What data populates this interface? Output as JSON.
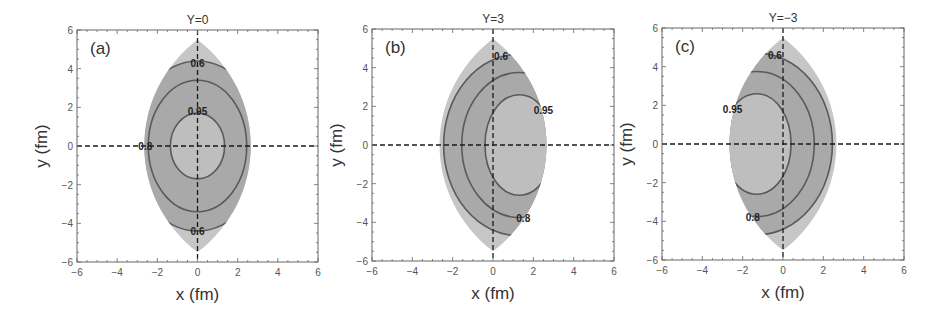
{
  "colors": {
    "background": "#ffffff",
    "frame": "#666666",
    "outer_region": "#c6c6c6",
    "middle_region": "#a9a9a9",
    "inner_region": "#bebebe",
    "contour_line": "#5a5a5a",
    "axis_dash": "#1a1a1a"
  },
  "chart_data": [
    {
      "type": "contour",
      "panel_tag": "(a)",
      "title": "Y=0",
      "xlabel": "x (fm)",
      "ylabel": "y (fm)",
      "xlim": [
        -6,
        6
      ],
      "ylim": [
        -6,
        6
      ],
      "xticks": [
        -6,
        -4,
        -2,
        0,
        2,
        4,
        6
      ],
      "yticks": [
        -6,
        -4,
        -2,
        0,
        2,
        4,
        6
      ],
      "grid": false,
      "dashed_axes_at_origin": true,
      "region": {
        "shape": "lens",
        "half_width": 2.65,
        "half_height": 5.5
      },
      "contours": [
        {
          "level": 0.6,
          "shape": "ellipse",
          "cx": 0,
          "cy": 0,
          "rx": 3.3,
          "ry": 4.4,
          "label_pos": [
            0,
            4.3
          ]
        },
        {
          "level": 0.8,
          "shape": "ellipse",
          "cx": 0,
          "cy": 0,
          "rx": 2.45,
          "ry": 3.4,
          "label_pos": [
            -2.6,
            0
          ]
        },
        {
          "level": 0.95,
          "shape": "ellipse",
          "cx": 0,
          "cy": 0,
          "rx": 1.35,
          "ry": 1.7,
          "label_pos": [
            0,
            1.8
          ]
        }
      ],
      "extra_labels": [
        {
          "text": "0.6",
          "pos": [
            0,
            -4.4
          ]
        }
      ]
    },
    {
      "type": "contour",
      "panel_tag": "(b)",
      "title": "Y=3",
      "xlabel": "x (fm)",
      "ylabel": "y (fm)",
      "xlim": [
        -6,
        6
      ],
      "ylim": [
        -6,
        6
      ],
      "xticks": [
        -6,
        -4,
        -2,
        0,
        2,
        4,
        6
      ],
      "yticks": [
        -6,
        -4,
        -2,
        0,
        2,
        4,
        6
      ],
      "grid": false,
      "dashed_axes_at_origin": true,
      "region": {
        "shape": "lens",
        "half_width": 2.65,
        "half_height": 5.5
      },
      "contours": [
        {
          "level": 0.6,
          "shape": "ellipse",
          "cx": 1.3,
          "cy": 0,
          "rx": 3.75,
          "ry": 4.7,
          "label_pos": [
            0.4,
            4.6
          ]
        },
        {
          "level": 0.8,
          "shape": "ellipse",
          "cx": 1.3,
          "cy": 0,
          "rx": 2.85,
          "ry": 3.75,
          "label_pos": [
            1.5,
            -3.8
          ]
        },
        {
          "level": 0.95,
          "shape": "ellipse",
          "cx": 1.3,
          "cy": 0,
          "rx": 1.7,
          "ry": 2.6,
          "label_pos": [
            2.5,
            1.8
          ]
        }
      ],
      "extra_labels": []
    },
    {
      "type": "contour",
      "panel_tag": "(c)",
      "title": "Y=−3",
      "xlabel": "x (fm)",
      "ylabel": "y (fm)",
      "xlim": [
        -6,
        6
      ],
      "ylim": [
        -6,
        6
      ],
      "xticks": [
        -6,
        -4,
        -2,
        0,
        2,
        4,
        6
      ],
      "yticks": [
        -6,
        -4,
        -2,
        0,
        2,
        4,
        6
      ],
      "grid": false,
      "dashed_axes_at_origin": true,
      "region": {
        "shape": "lens",
        "half_width": 2.65,
        "half_height": 5.5
      },
      "contours": [
        {
          "level": 0.6,
          "shape": "ellipse",
          "cx": -1.3,
          "cy": 0,
          "rx": 3.75,
          "ry": 4.7,
          "label_pos": [
            -0.4,
            4.6
          ]
        },
        {
          "level": 0.8,
          "shape": "ellipse",
          "cx": -1.3,
          "cy": 0,
          "rx": 2.85,
          "ry": 3.75,
          "label_pos": [
            -1.5,
            -3.8
          ]
        },
        {
          "level": 0.95,
          "shape": "ellipse",
          "cx": -1.3,
          "cy": 0,
          "rx": 1.7,
          "ry": 2.6,
          "label_pos": [
            -2.5,
            1.8
          ]
        }
      ],
      "extra_labels": []
    }
  ],
  "layout": {
    "panels": [
      {
        "left": 77,
        "top": 30,
        "right": 318,
        "bottom": 262
      },
      {
        "left": 372,
        "top": 29,
        "right": 614,
        "bottom": 261
      },
      {
        "left": 662,
        "top": 28,
        "right": 904,
        "bottom": 260
      }
    ]
  }
}
